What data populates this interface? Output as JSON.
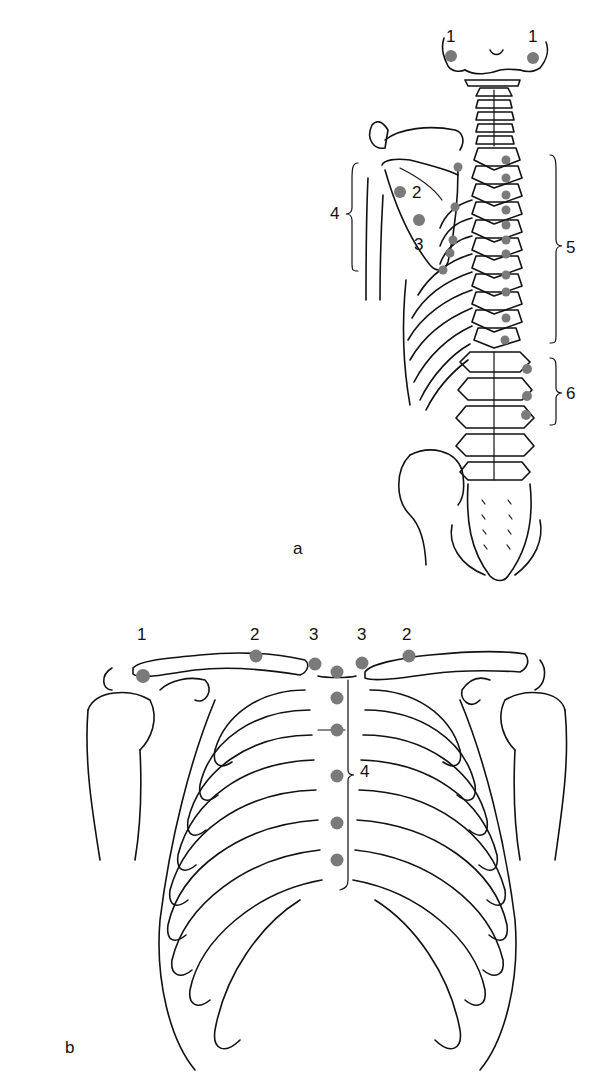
{
  "panels": [
    {
      "id": "a",
      "label": "a",
      "view": "posterior",
      "markers": [
        {
          "num": "1",
          "label": "1",
          "x": 451,
          "y": 56
        },
        {
          "num": "1",
          "label": "1",
          "x": 533,
          "y": 58
        },
        {
          "num": "2",
          "label": "2",
          "x": 400,
          "y": 192
        },
        {
          "num": "3",
          "label": "3",
          "x": 419,
          "y": 220
        },
        {
          "num": "4",
          "label": "4",
          "x": 336,
          "y": 212
        },
        {
          "num": "5",
          "label": "5",
          "x": 567,
          "y": 248
        },
        {
          "num": "6",
          "label": "6",
          "x": 567,
          "y": 394
        }
      ],
      "dots": [
        [
          451,
          56
        ],
        [
          533,
          58
        ],
        [
          400,
          192
        ],
        [
          419,
          220
        ],
        [
          458,
          167
        ],
        [
          455,
          207
        ],
        [
          453,
          240
        ],
        [
          450,
          253
        ],
        [
          443,
          270
        ],
        [
          506,
          160
        ],
        [
          506,
          178
        ],
        [
          506,
          195
        ],
        [
          506,
          210
        ],
        [
          506,
          225
        ],
        [
          506,
          240
        ],
        [
          506,
          254
        ],
        [
          506,
          275
        ],
        [
          506,
          292
        ],
        [
          506,
          318
        ],
        [
          505,
          340
        ],
        [
          527,
          369
        ],
        [
          527,
          396
        ],
        [
          526,
          415
        ]
      ],
      "brackets": [
        {
          "num": "4",
          "side": "left",
          "x": 355,
          "y1": 163,
          "y2": 271
        },
        {
          "num": "5",
          "side": "right",
          "x": 556,
          "y1": 155,
          "y2": 343
        },
        {
          "num": "6",
          "side": "right",
          "x": 556,
          "y1": 358,
          "y2": 425
        }
      ]
    },
    {
      "id": "b",
      "label": "b",
      "view": "anterior",
      "markers": [
        {
          "num": "1",
          "label": "1",
          "x": 143,
          "y": 634
        },
        {
          "num": "2",
          "label": "2",
          "x": 256,
          "y": 634
        },
        {
          "num": "3",
          "label": "3",
          "x": 315,
          "y": 634
        },
        {
          "num": "3",
          "label": "3",
          "x": 363,
          "y": 634
        },
        {
          "num": "2",
          "label": "2",
          "x": 408,
          "y": 634
        },
        {
          "num": "4",
          "label": "4",
          "x": 368,
          "y": 771
        }
      ],
      "dots": [
        [
          143,
          676
        ],
        [
          256,
          656
        ],
        [
          315,
          664
        ],
        [
          337,
          672
        ],
        [
          362,
          663
        ],
        [
          409,
          656
        ],
        [
          337,
          698
        ],
        [
          337,
          730
        ],
        [
          337,
          776
        ],
        [
          337,
          823
        ],
        [
          337,
          860
        ]
      ]
    }
  ],
  "colors": {
    "line": "#111111",
    "marker": "#7a7a7a",
    "background": "#ffffff"
  }
}
